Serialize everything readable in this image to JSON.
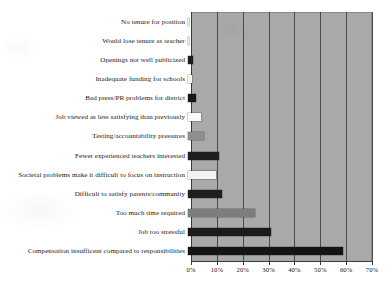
{
  "chart_data": {
    "type": "bar",
    "orientation": "horizontal",
    "title": "",
    "subtitle": "",
    "xlabel": "",
    "ylabel": "",
    "xlim": [
      0,
      70
    ],
    "xtick_labels": [
      "0%",
      "10%",
      "20%",
      "30%",
      "40%",
      "50%",
      "60%",
      "70%"
    ],
    "xtick_values": [
      0,
      10,
      20,
      30,
      40,
      50,
      60,
      70
    ],
    "grid": "vertical",
    "legend": "none",
    "plot_background": "#a9a9a9",
    "categories": [
      "No tenure for position",
      "Would lose tenure as teacher",
      "Openings not well publicized",
      "Inadequate funding for schools",
      "Bad press/PR problems for district",
      "Job viewed as less satisfying than previously",
      "Testing/accountability pressures",
      "Fewer experienced teachers interested",
      "Societal problems make it difficult to focus on instruction",
      "Difficult to satisfy parents/community",
      "Too much time required",
      "Job too stressful",
      "Compensation insufficent compared to responsibilities"
    ],
    "values": [
      0.5,
      0.5,
      2,
      1.5,
      3,
      5,
      6,
      12,
      11,
      13,
      26,
      32,
      60
    ],
    "bar_colors": [
      "#f2f2f2",
      "#efefef",
      "#1c1c1c",
      "#f5f5f5",
      "#181818",
      "#fbfbfb",
      "#8f8f8f",
      "#1f1f1f",
      "#f3f3f3",
      "#1e1e1e",
      "#7d7d7d",
      "#1a1a1a",
      "#141414"
    ]
  }
}
